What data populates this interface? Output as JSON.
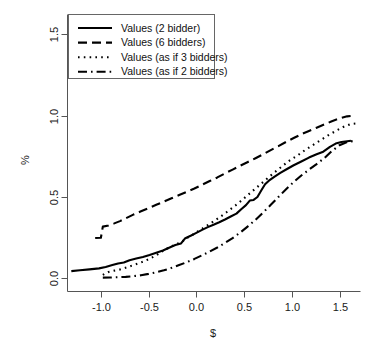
{
  "chart_data": {
    "type": "line",
    "title": "",
    "subtitle": "",
    "xlabel": "$",
    "ylabel": "%",
    "xlim": [
      -1.35,
      1.72
    ],
    "ylim": [
      -0.08,
      1.62
    ],
    "xticks": [
      -1.0,
      -0.5,
      0.0,
      0.5,
      1.0,
      1.5
    ],
    "xticklabels": [
      "-1.0",
      "-0.5",
      "0.0",
      "0.5",
      "1.0",
      "1.5"
    ],
    "yticks": [
      0.0,
      0.5,
      1.0,
      1.5
    ],
    "yticklabels": [
      "0.0",
      "0.5",
      "1.0",
      "1.5"
    ],
    "grid": false,
    "legend_position": "top-left",
    "series": [
      {
        "name": "Values (2 bidder)",
        "dash": "solid",
        "linewidth": 2.1,
        "points": [
          [
            -1.31,
            0.045
          ],
          [
            -1.22,
            0.05
          ],
          [
            -1.12,
            0.056
          ],
          [
            -1.02,
            0.062
          ],
          [
            -0.95,
            0.07
          ],
          [
            -0.88,
            0.082
          ],
          [
            -0.82,
            0.092
          ],
          [
            -0.76,
            0.098
          ],
          [
            -0.7,
            0.112
          ],
          [
            -0.63,
            0.122
          ],
          [
            -0.56,
            0.132
          ],
          [
            -0.49,
            0.144
          ],
          [
            -0.42,
            0.158
          ],
          [
            -0.35,
            0.172
          ],
          [
            -0.28,
            0.19
          ],
          [
            -0.22,
            0.205
          ],
          [
            -0.16,
            0.215
          ],
          [
            -0.12,
            0.245
          ],
          [
            -0.06,
            0.262
          ],
          [
            0.0,
            0.28
          ],
          [
            0.06,
            0.298
          ],
          [
            0.12,
            0.315
          ],
          [
            0.18,
            0.33
          ],
          [
            0.24,
            0.345
          ],
          [
            0.3,
            0.362
          ],
          [
            0.36,
            0.38
          ],
          [
            0.42,
            0.398
          ],
          [
            0.47,
            0.425
          ],
          [
            0.52,
            0.45
          ],
          [
            0.56,
            0.478
          ],
          [
            0.6,
            0.482
          ],
          [
            0.64,
            0.5
          ],
          [
            0.68,
            0.54
          ],
          [
            0.72,
            0.578
          ],
          [
            0.76,
            0.6
          ],
          [
            0.82,
            0.625
          ],
          [
            0.88,
            0.648
          ],
          [
            0.95,
            0.672
          ],
          [
            1.02,
            0.695
          ],
          [
            1.1,
            0.718
          ],
          [
            1.18,
            0.742
          ],
          [
            1.26,
            0.762
          ],
          [
            1.33,
            0.778
          ],
          [
            1.4,
            0.808
          ],
          [
            1.46,
            0.828
          ],
          [
            1.52,
            0.838
          ],
          [
            1.58,
            0.842
          ],
          [
            1.62,
            0.845
          ]
        ]
      },
      {
        "name": "Values (6 bidders)",
        "dash": "dashed",
        "linewidth": 2.1,
        "points": [
          [
            -1.06,
            0.248
          ],
          [
            -1.0,
            0.25
          ],
          [
            -0.98,
            0.318
          ],
          [
            -0.92,
            0.325
          ],
          [
            -0.86,
            0.338
          ],
          [
            -0.8,
            0.352
          ],
          [
            -0.73,
            0.372
          ],
          [
            -0.66,
            0.392
          ],
          [
            -0.58,
            0.412
          ],
          [
            -0.5,
            0.432
          ],
          [
            -0.42,
            0.452
          ],
          [
            -0.34,
            0.472
          ],
          [
            -0.26,
            0.492
          ],
          [
            -0.18,
            0.512
          ],
          [
            -0.1,
            0.532
          ],
          [
            -0.02,
            0.552
          ],
          [
            0.06,
            0.575
          ],
          [
            0.14,
            0.598
          ],
          [
            0.22,
            0.62
          ],
          [
            0.3,
            0.645
          ],
          [
            0.38,
            0.668
          ],
          [
            0.46,
            0.692
          ],
          [
            0.54,
            0.715
          ],
          [
            0.62,
            0.738
          ],
          [
            0.7,
            0.762
          ],
          [
            0.78,
            0.788
          ],
          [
            0.86,
            0.812
          ],
          [
            0.94,
            0.838
          ],
          [
            1.02,
            0.862
          ],
          [
            1.1,
            0.885
          ],
          [
            1.18,
            0.905
          ],
          [
            1.26,
            0.925
          ],
          [
            1.34,
            0.945
          ],
          [
            1.42,
            0.965
          ],
          [
            1.5,
            0.982
          ],
          [
            1.58,
            0.995
          ],
          [
            1.66,
            1.0
          ]
        ]
      },
      {
        "name": "Values (as if 3 bidders)",
        "dash": "dotted",
        "linewidth": 2.1,
        "points": [
          [
            -0.98,
            0.022
          ],
          [
            -0.92,
            0.04
          ],
          [
            -0.86,
            0.048
          ],
          [
            -0.8,
            0.055
          ],
          [
            -0.73,
            0.068
          ],
          [
            -0.66,
            0.082
          ],
          [
            -0.58,
            0.098
          ],
          [
            -0.5,
            0.118
          ],
          [
            -0.42,
            0.142
          ],
          [
            -0.35,
            0.17
          ],
          [
            -0.28,
            0.192
          ],
          [
            -0.22,
            0.208
          ],
          [
            -0.16,
            0.222
          ],
          [
            -0.1,
            0.248
          ],
          [
            -0.04,
            0.268
          ],
          [
            0.02,
            0.29
          ],
          [
            0.08,
            0.312
          ],
          [
            0.14,
            0.335
          ],
          [
            0.2,
            0.358
          ],
          [
            0.26,
            0.382
          ],
          [
            0.32,
            0.408
          ],
          [
            0.38,
            0.435
          ],
          [
            0.44,
            0.462
          ],
          [
            0.5,
            0.492
          ],
          [
            0.56,
            0.522
          ],
          [
            0.62,
            0.552
          ],
          [
            0.68,
            0.582
          ],
          [
            0.74,
            0.612
          ],
          [
            0.8,
            0.642
          ],
          [
            0.86,
            0.67
          ],
          [
            0.92,
            0.698
          ],
          [
            0.98,
            0.725
          ],
          [
            1.06,
            0.755
          ],
          [
            1.14,
            0.788
          ],
          [
            1.22,
            0.818
          ],
          [
            1.3,
            0.848
          ],
          [
            1.38,
            0.878
          ],
          [
            1.46,
            0.905
          ],
          [
            1.54,
            0.93
          ],
          [
            1.62,
            0.948
          ],
          [
            1.68,
            0.952
          ]
        ]
      },
      {
        "name": "Values (as if 2 bidders)",
        "dash": "dashdot",
        "linewidth": 2.1,
        "points": [
          [
            -0.98,
            0.005
          ],
          [
            -0.9,
            0.006
          ],
          [
            -0.82,
            0.008
          ],
          [
            -0.74,
            0.01
          ],
          [
            -0.66,
            0.014
          ],
          [
            -0.58,
            0.02
          ],
          [
            -0.5,
            0.028
          ],
          [
            -0.42,
            0.038
          ],
          [
            -0.34,
            0.05
          ],
          [
            -0.26,
            0.065
          ],
          [
            -0.18,
            0.082
          ],
          [
            -0.1,
            0.1
          ],
          [
            -0.02,
            0.12
          ],
          [
            0.06,
            0.142
          ],
          [
            0.14,
            0.165
          ],
          [
            0.22,
            0.19
          ],
          [
            0.3,
            0.218
          ],
          [
            0.38,
            0.248
          ],
          [
            0.46,
            0.282
          ],
          [
            0.54,
            0.32
          ],
          [
            0.62,
            0.36
          ],
          [
            0.7,
            0.405
          ],
          [
            0.78,
            0.452
          ],
          [
            0.86,
            0.5
          ],
          [
            0.94,
            0.548
          ],
          [
            1.02,
            0.592
          ],
          [
            1.1,
            0.632
          ],
          [
            1.18,
            0.668
          ],
          [
            1.26,
            0.702
          ],
          [
            1.34,
            0.738
          ],
          [
            1.42,
            0.782
          ],
          [
            1.5,
            0.818
          ],
          [
            1.58,
            0.838
          ],
          [
            1.66,
            0.845
          ]
        ]
      }
    ]
  },
  "legend": {
    "items": [
      {
        "label": "Values (2 bidder)"
      },
      {
        "label": "Values (6 bidders)"
      },
      {
        "label": "Values (as if 3 bidders)"
      },
      {
        "label": "Values (as if 2 bidders)"
      }
    ]
  },
  "axes": {
    "x_title": "$",
    "y_title": "%",
    "x_tick_labels": [
      "-1.0",
      "-0.5",
      "0.0",
      "0.5",
      "1.0",
      "1.5"
    ],
    "y_tick_labels": [
      "0.0",
      "0.5",
      "1.0",
      "1.5"
    ]
  }
}
